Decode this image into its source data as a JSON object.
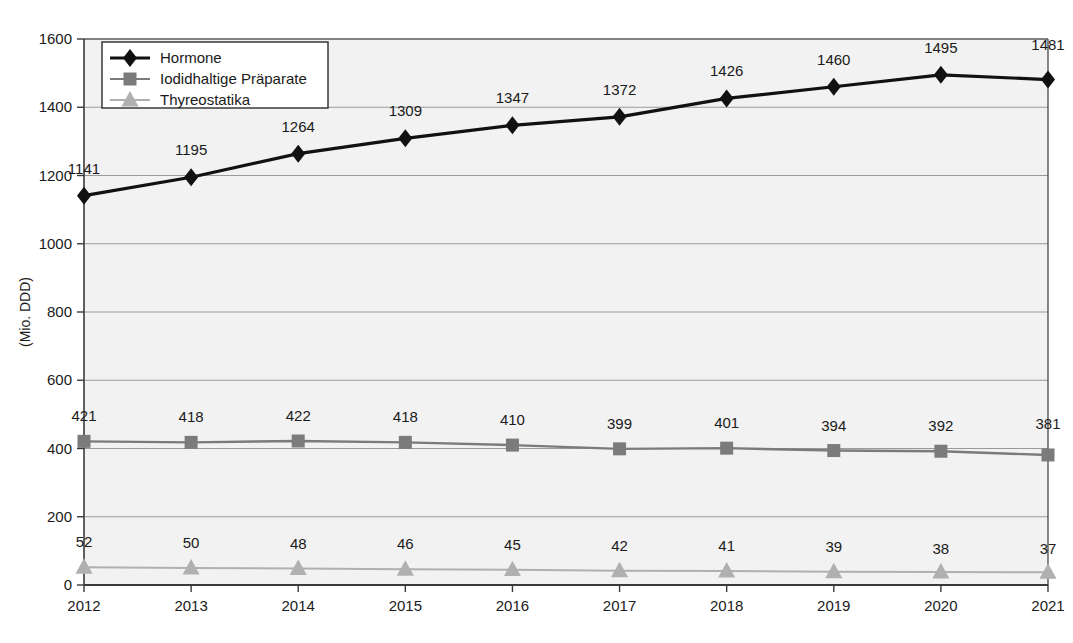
{
  "chart_data": {
    "type": "line",
    "title": "",
    "subtitle": "",
    "xlabel": "",
    "ylabel": "(Mio. DDD)",
    "categories": [
      "2012",
      "2013",
      "2014",
      "2015",
      "2016",
      "2017",
      "2018",
      "2019",
      "2020",
      "2021"
    ],
    "x": [
      2012,
      2013,
      2014,
      2015,
      2016,
      2017,
      2018,
      2019,
      2020,
      2021
    ],
    "ylim": [
      0,
      1600
    ],
    "yticks": [
      0,
      200,
      400,
      600,
      800,
      1000,
      1200,
      1400,
      1600
    ],
    "ytick_labels": [
      "0",
      "200",
      "400",
      "600",
      "800",
      "1000",
      "1200",
      "1400",
      "1600"
    ],
    "grid": true,
    "grid_axis": "y",
    "legend_position": "top-left",
    "data_labels": true,
    "series": [
      {
        "name": "Hormone",
        "marker": "diamond",
        "color": "#111111",
        "values": [
          1141,
          1195,
          1264,
          1309,
          1347,
          1372,
          1426,
          1460,
          1495,
          1481
        ],
        "labels": [
          "1141",
          "1195",
          "1264",
          "1309",
          "1347",
          "1372",
          "1426",
          "1460",
          "1495",
          "1481"
        ]
      },
      {
        "name": "Iodidhaltige Präparate",
        "marker": "square",
        "color": "#7b7b7b",
        "values": [
          421,
          418,
          422,
          418,
          410,
          399,
          401,
          394,
          392,
          381
        ],
        "labels": [
          "421",
          "418",
          "422",
          "418",
          "410",
          "399",
          "401",
          "394",
          "392",
          "381"
        ]
      },
      {
        "name": "Thyreostatika",
        "marker": "triangle",
        "color": "#b0b0b0",
        "values": [
          52,
          50,
          48,
          46,
          45,
          42,
          41,
          39,
          38,
          37
        ],
        "labels": [
          "52",
          "50",
          "48",
          "46",
          "45",
          "42",
          "41",
          "39",
          "38",
          "37"
        ]
      }
    ]
  },
  "legend": {
    "items": [
      {
        "label": "Hormone",
        "marker_name": "diamond-marker-icon"
      },
      {
        "label": "Iodidhaltige Präparate",
        "marker_name": "square-marker-icon"
      },
      {
        "label": "Thyreostatika",
        "marker_name": "triangle-marker-icon"
      }
    ]
  },
  "style": {
    "plot_background": "#f2f2f2",
    "grid_color": "#9a9a9a",
    "axis_color": "#3a3a3a",
    "hormone_color": "#111111",
    "iodid_color": "#7b7b7b",
    "thyreo_color": "#b0b0b0"
  }
}
